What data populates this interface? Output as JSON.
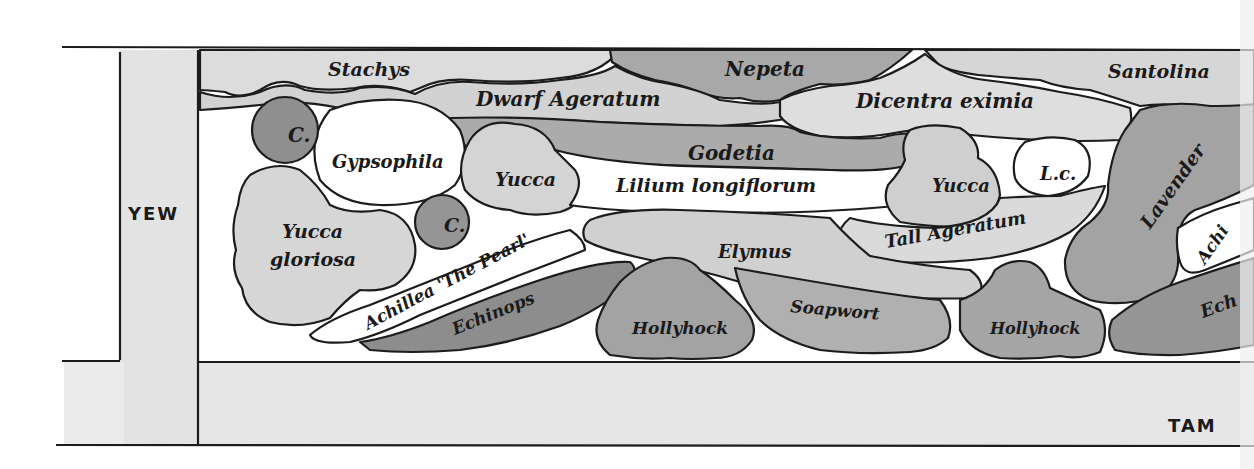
{
  "diagram": {
    "type": "garden border planting plan",
    "colors": {
      "paper": "#ffffff",
      "path_band": "#e6e6e6",
      "yew": "#e3e3e3",
      "light": "#d9d9d9",
      "medium": "#bdbdbd",
      "dark": "#9a9a9a",
      "darkest": "#8a8a8a",
      "outline": "#1c1c1c"
    },
    "hedges": {
      "left": "YEW",
      "bottom_right": "TAM"
    },
    "plants": {
      "stachys": "Stachys",
      "nepeta": "Nepeta",
      "santolina": "Santolina",
      "dwarf_ageratum": "Dwarf Ageratum",
      "dicentra": "Dicentra eximia",
      "godetia": "Godetia",
      "c1": "C.",
      "c2": "C.",
      "gypsophila": "Gypsophila",
      "yucca1": "Yucca",
      "lilium": "Lilium longiflorum",
      "yucca2": "Yucca",
      "lc": "L.c.",
      "lavender": "Lavender",
      "yucca_gloriosa_1": "Yucca",
      "yucca_gloriosa_2": "gloriosa",
      "elymus": "Elymus",
      "tall_ageratum": "Tall Ageratum",
      "achillea": "Achillea 'The Pearl'",
      "echinops": "Echinops",
      "hollyhock1": "Hollyhock",
      "soapwort": "Soapwort",
      "hollyhock2": "Hollyhock",
      "achillea_cut": "Achi",
      "echinops_cut": "Ech"
    }
  }
}
